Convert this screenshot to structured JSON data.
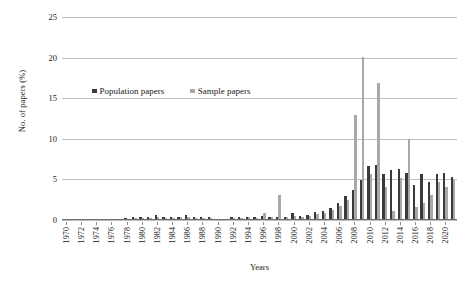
{
  "chart_data": {
    "type": "bar",
    "title": "",
    "xlabel": "Years",
    "ylabel": "No. of papers (%)",
    "ylim": [
      0,
      25
    ],
    "yticks": [
      0,
      5,
      10,
      15,
      20,
      25
    ],
    "ytick_labels": [
      "0",
      "5",
      "10",
      "15",
      "20",
      "25"
    ],
    "grid": true,
    "legend_position": "upper-left-inside",
    "x_tick_step": 2,
    "categories": [
      "1970",
      "1971",
      "1972",
      "1973",
      "1974",
      "1975",
      "1976",
      "1977",
      "1978",
      "1979",
      "1980",
      "1981",
      "1982",
      "1983",
      "1984",
      "1985",
      "1986",
      "1987",
      "1988",
      "1989",
      "1990",
      "1991",
      "1992",
      "1993",
      "1994",
      "1995",
      "1996",
      "1997",
      "1998",
      "1999",
      "2000",
      "2001",
      "2002",
      "2003",
      "2004",
      "2005",
      "2006",
      "2007",
      "2008",
      "2009",
      "2010",
      "2011",
      "2012",
      "2013",
      "2014",
      "2015",
      "2016",
      "2017",
      "2018",
      "2019",
      "2020",
      "2021"
    ],
    "xtick_labels": [
      "1970",
      "1972",
      "1974",
      "1976",
      "1978",
      "1980",
      "1982",
      "1984",
      "1986",
      "1988",
      "1990",
      "1992",
      "1994",
      "1996",
      "1998",
      "2000",
      "2002",
      "2004",
      "2006",
      "2008",
      "2010",
      "2012",
      "2014",
      "2016",
      "2018",
      "2020"
    ],
    "series": [
      {
        "name": "Population papers",
        "color": "#3a3a3a",
        "values": [
          0,
          0,
          0,
          0,
          0,
          0,
          0,
          0,
          0.1,
          0.2,
          0.2,
          0.2,
          0.5,
          0.2,
          0.2,
          0.3,
          0.5,
          0.2,
          0.3,
          0.2,
          0,
          0,
          0.2,
          0.2,
          0.3,
          0.2,
          0.4,
          0.2,
          0.3,
          0.2,
          0.8,
          0.4,
          0.5,
          0.9,
          1.0,
          1.4,
          2.0,
          2.8,
          3.6,
          4.8,
          6.5,
          6.7,
          5.6,
          6.0,
          6.1,
          5.7,
          4.2,
          5.5,
          4.5,
          5.6,
          5.7,
          5.2
        ]
      },
      {
        "name": "Sample papers",
        "color": "#a8a8a8",
        "values": [
          0,
          0,
          0,
          0,
          0,
          0,
          0,
          0,
          0,
          0.1,
          0.1,
          0.1,
          0.2,
          0.1,
          0.1,
          0.2,
          0.2,
          0.1,
          0.1,
          0.1,
          0,
          0,
          0.1,
          0.1,
          0.2,
          0.1,
          0.7,
          0.2,
          3.0,
          0.2,
          0.4,
          0.3,
          0.4,
          0.6,
          0.8,
          1.1,
          1.6,
          2.4,
          12.8,
          20.0,
          5.6,
          16.8,
          4.0,
          1.0,
          5.0,
          9.9,
          1.5,
          2.0,
          3.0,
          4.6,
          4.0,
          4.8
        ]
      }
    ]
  },
  "legend": {
    "items": [
      {
        "label": "Population papers",
        "color": "#3a3a3a"
      },
      {
        "label": "Sample papers",
        "color": "#a8a8a8"
      }
    ]
  }
}
